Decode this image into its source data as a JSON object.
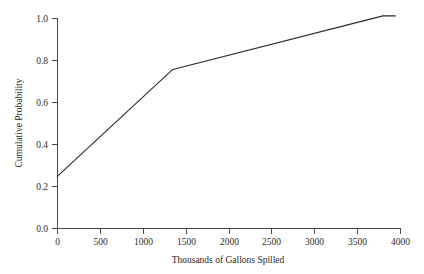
{
  "chart_data": {
    "type": "line",
    "title": "",
    "subtitle": "",
    "xlabel": "Thousands of Gallons Spilled",
    "ylabel": "Cumulative Probability",
    "xlim": [
      0,
      4000
    ],
    "ylim": [
      0.0,
      1.0
    ],
    "grid": false,
    "legend": null,
    "legend_position": "none",
    "xticks": [
      0,
      500,
      1000,
      1500,
      2000,
      2500,
      3000,
      3500,
      4000
    ],
    "xtick_labels": [
      "0",
      "500",
      "1000",
      "1500",
      "2000",
      "2500",
      "3000",
      "3500",
      "4000"
    ],
    "yticks": [
      0.0,
      0.2,
      0.4,
      0.6,
      0.8,
      1.0
    ],
    "ytick_labels": [
      "0.0",
      "0.2",
      "0.4",
      "0.6",
      "0.8",
      "1.0"
    ],
    "series": [
      {
        "name": "Cumulative Probability",
        "color": "#2a2a2a",
        "x": [
          0,
          1350,
          3800,
          3950
        ],
        "y": [
          0.245,
          0.755,
          1.01,
          1.01
        ]
      }
    ],
    "annotations": []
  },
  "axes": {
    "x_axis_name": "x-axis",
    "y_axis_name": "y-axis"
  }
}
